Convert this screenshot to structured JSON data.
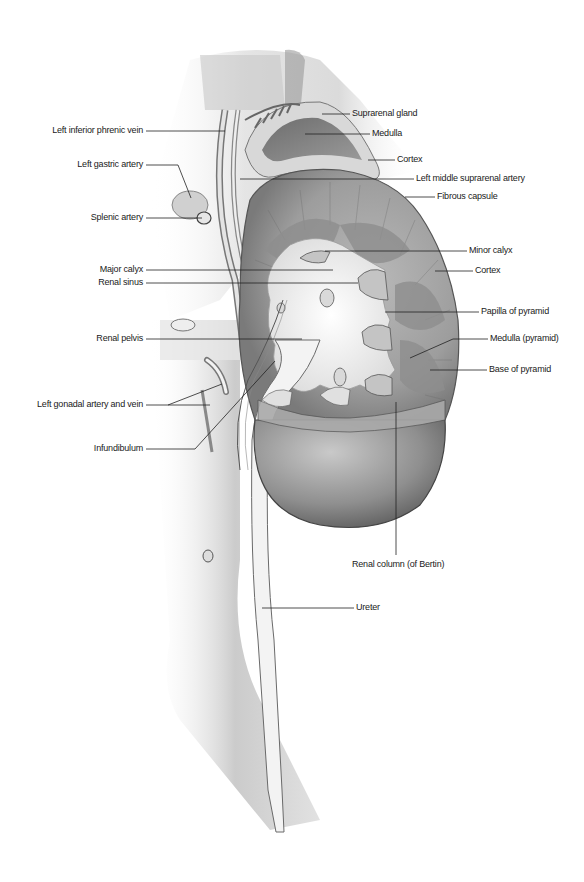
{
  "figure": {
    "colors": {
      "background": "#ffffff",
      "leader_line": "#222222",
      "text": "#1a1a1a"
    }
  },
  "labels_left": [
    {
      "text": "Left inferior phrenic vein",
      "x_end": 145,
      "y": 131,
      "target": [
        225,
        131
      ]
    },
    {
      "text": "Left gastric artery",
      "x_end": 145,
      "y": 165,
      "target": [
        191,
        198
      ],
      "elbow": [
        178,
        165
      ]
    },
    {
      "text": "Splenic artery",
      "x_end": 145,
      "y": 218,
      "target": [
        202,
        218
      ]
    },
    {
      "text": "Major calyx",
      "x_end": 145,
      "y": 270,
      "target": [
        333,
        270
      ]
    },
    {
      "text": "Renal sinus",
      "x_end": 145,
      "y": 283,
      "target": [
        358,
        283
      ]
    },
    {
      "text": "Renal pelvis",
      "x_end": 145,
      "y": 339,
      "target": [
        302,
        339
      ]
    },
    {
      "text": "Left gonadal artery and vein",
      "x_end": 145,
      "y": 405,
      "targets": [
        [
          222,
          384
        ],
        [
          210,
          405
        ]
      ]
    },
    {
      "text": "Infundibulum",
      "x_end": 145,
      "y": 449,
      "target": [
        275,
        361
      ],
      "elbow": [
        195,
        449
      ]
    }
  ],
  "labels_right": [
    {
      "text": "Suprarenal gland",
      "x_start": 352,
      "y": 114,
      "target": [
        322,
        114
      ]
    },
    {
      "text": "Medulla",
      "x_start": 372,
      "y": 134,
      "target": [
        305,
        134
      ]
    },
    {
      "text": "Cortex",
      "x_start": 397,
      "y": 160,
      "target": [
        368,
        160
      ]
    },
    {
      "text": "Left middle suprarenal artery",
      "x_start": 416,
      "y": 179,
      "target": [
        240,
        179
      ]
    },
    {
      "text": "Fibrous capsule",
      "x_start": 437,
      "y": 197,
      "target": [
        405,
        197
      ]
    },
    {
      "text": "Minor calyx",
      "x_start": 469,
      "y": 251,
      "target": [
        325,
        251
      ]
    },
    {
      "text": "Cortex",
      "x_start": 475,
      "y": 271,
      "target": [
        435,
        271
      ]
    },
    {
      "text": "Papilla of pyramid",
      "x_start": 481,
      "y": 312,
      "target": [
        385,
        312
      ]
    },
    {
      "text": "Medulla (pyramid)",
      "x_start": 490,
      "y": 339,
      "target": [
        410,
        358
      ],
      "elbow": [
        453,
        339
      ]
    },
    {
      "text": "Base of pyramid",
      "x_start": 489,
      "y": 370,
      "target": [
        430,
        370
      ]
    },
    {
      "text": "Renal column (of Bertin)",
      "x_start": 352,
      "y": 565,
      "target": [
        396,
        402
      ],
      "elbow": [
        396,
        555
      ],
      "align": "below"
    },
    {
      "text": "Ureter",
      "x_start": 356,
      "y": 608,
      "target": [
        262,
        608
      ]
    }
  ]
}
